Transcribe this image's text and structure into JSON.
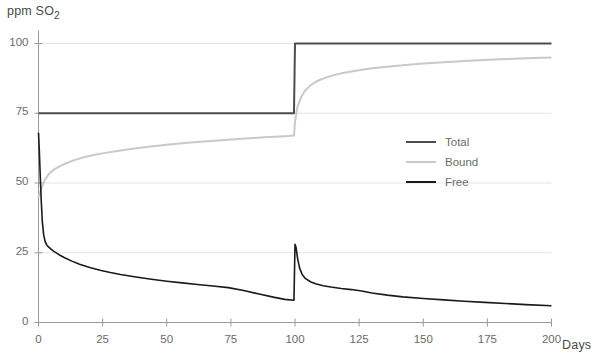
{
  "chart_data": {
    "type": "line",
    "title": "",
    "ylabel": "ppm SO2",
    "ylabel_display": "ppm SO₂",
    "xlabel": "Days",
    "xlim": [
      0,
      200
    ],
    "ylim": [
      0,
      100
    ],
    "xticks": [
      0,
      25,
      50,
      75,
      100,
      125,
      150,
      175,
      200
    ],
    "yticks": [
      0,
      25,
      50,
      75,
      100
    ],
    "grid": "horizontal",
    "legend_position": "center-right",
    "annotations": [
      "Step addition of SO2 at day 100: Total rises 75 to 100"
    ],
    "series": [
      {
        "name": "Total",
        "color": "#4d4d4d",
        "width": 2.0,
        "points": [
          [
            0,
            75
          ],
          [
            99.6,
            75
          ],
          [
            100,
            100
          ],
          [
            200,
            100
          ]
        ]
      },
      {
        "name": "Bound",
        "color": "#c9c9c9",
        "width": 2.0,
        "points": [
          [
            0,
            45
          ],
          [
            0.6,
            46.5
          ],
          [
            1.5,
            49
          ],
          [
            2.5,
            51.2
          ],
          [
            4,
            53.2
          ],
          [
            6,
            54.8
          ],
          [
            8,
            55.9
          ],
          [
            10,
            56.8
          ],
          [
            14,
            58.2
          ],
          [
            18,
            59.3
          ],
          [
            22,
            60.1
          ],
          [
            26,
            60.8
          ],
          [
            30,
            61.4
          ],
          [
            36,
            62.2
          ],
          [
            42,
            62.9
          ],
          [
            50,
            63.7
          ],
          [
            58,
            64.4
          ],
          [
            66,
            65.0
          ],
          [
            74,
            65.5
          ],
          [
            82,
            66.0
          ],
          [
            90,
            66.5
          ],
          [
            96,
            66.8
          ],
          [
            99.6,
            67.0
          ],
          [
            100,
            72.0
          ],
          [
            101,
            77.5
          ],
          [
            102.5,
            81.0
          ],
          [
            104,
            83.2
          ],
          [
            106,
            85.0
          ],
          [
            108,
            86.2
          ],
          [
            110,
            87.1
          ],
          [
            114,
            88.4
          ],
          [
            118,
            89.3
          ],
          [
            122,
            90.0
          ],
          [
            126,
            90.6
          ],
          [
            130,
            91.1
          ],
          [
            136,
            91.7
          ],
          [
            142,
            92.2
          ],
          [
            150,
            92.8
          ],
          [
            158,
            93.3
          ],
          [
            166,
            93.7
          ],
          [
            174,
            94.1
          ],
          [
            182,
            94.4
          ],
          [
            190,
            94.7
          ],
          [
            200,
            95.0
          ]
        ]
      },
      {
        "name": "Free",
        "color": "#1a1a1a",
        "width": 1.6,
        "points": [
          [
            0,
            68
          ],
          [
            0.3,
            62
          ],
          [
            0.7,
            52
          ],
          [
            1.1,
            43
          ],
          [
            1.5,
            36
          ],
          [
            2.0,
            31.5
          ],
          [
            2.6,
            29.0
          ],
          [
            3.2,
            27.8
          ],
          [
            4,
            27.0
          ],
          [
            5,
            26.2
          ],
          [
            6,
            25.5
          ],
          [
            8,
            24.3
          ],
          [
            10,
            23.3
          ],
          [
            13,
            22.0
          ],
          [
            16,
            20.9
          ],
          [
            20,
            19.7
          ],
          [
            24,
            18.7
          ],
          [
            28,
            17.9
          ],
          [
            32,
            17.2
          ],
          [
            38,
            16.3
          ],
          [
            44,
            15.5
          ],
          [
            50,
            14.8
          ],
          [
            56,
            14.2
          ],
          [
            62,
            13.6
          ],
          [
            68,
            13.1
          ],
          [
            74,
            12.5
          ],
          [
            80,
            11.5
          ],
          [
            86,
            10.2
          ],
          [
            92,
            9.0
          ],
          [
            96,
            8.3
          ],
          [
            99.6,
            8.0
          ],
          [
            100,
            28.0
          ],
          [
            100.4,
            27.0
          ],
          [
            101,
            23.0
          ],
          [
            101.8,
            19.5
          ],
          [
            102.8,
            17.2
          ],
          [
            104,
            15.8
          ],
          [
            106,
            14.6
          ],
          [
            108,
            13.9
          ],
          [
            111,
            13.2
          ],
          [
            114,
            12.7
          ],
          [
            118,
            12.2
          ],
          [
            122,
            11.8
          ],
          [
            126,
            11.3
          ],
          [
            130,
            10.6
          ],
          [
            136,
            9.8
          ],
          [
            142,
            9.2
          ],
          [
            150,
            8.6
          ],
          [
            158,
            8.1
          ],
          [
            166,
            7.6
          ],
          [
            174,
            7.2
          ],
          [
            182,
            6.8
          ],
          [
            190,
            6.4
          ],
          [
            200,
            6.0
          ]
        ]
      }
    ]
  },
  "legend": {
    "items": [
      {
        "label": "Total",
        "color": "#4d4d4d",
        "width": 2.0
      },
      {
        "label": "Bound",
        "color": "#c9c9c9",
        "width": 2.0
      },
      {
        "label": "Free",
        "color": "#1a1a1a",
        "width": 2.0
      }
    ]
  },
  "style": {
    "background": "#ffffff",
    "grid_color": "#e4e4e4",
    "axis_color": "#9a9a9a",
    "tick_text_color": "#6b6b6b",
    "title_text_color": "#4a4a4a"
  }
}
